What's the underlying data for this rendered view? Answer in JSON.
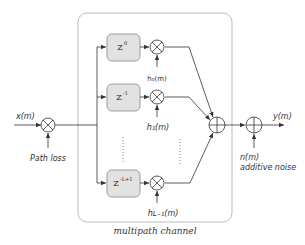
{
  "diagram": {
    "container": {
      "label": "multipath channel",
      "border_color": "#bbbbbb"
    },
    "input": {
      "signal": "x(m)",
      "path_loss_label": "Path loss"
    },
    "delays": [
      {
        "base": "Z",
        "exponent": "0"
      },
      {
        "base": "Z",
        "exponent": "-1"
      },
      {
        "base": "Z",
        "exponent": "-L+1"
      }
    ],
    "gains": [
      "h₀(m)",
      "h₁(m)",
      "hₗ₋₁(m)"
    ],
    "gain_labels": {
      "g0": "h₀(m)",
      "g1": "h₁(m)",
      "g2": "hʟ₋₁(m)"
    },
    "noise": {
      "label_1": "n(m)",
      "label_2": "additive noise"
    },
    "output": {
      "signal": "y(m)"
    },
    "colors": {
      "delay_fill": "#e2e2e2",
      "line": "#333333",
      "box_border": "#888888"
    }
  }
}
